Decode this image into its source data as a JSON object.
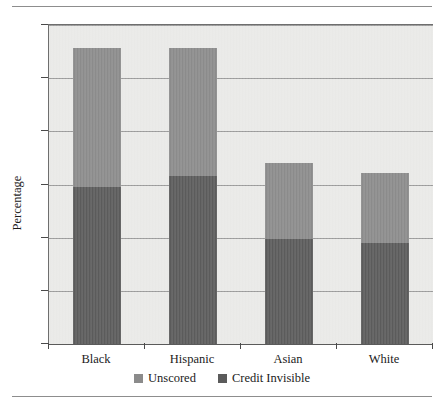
{
  "chart_data": {
    "type": "bar",
    "subtype": "stacked-vertical",
    "title": "",
    "xlabel": "",
    "ylabel": "Percentage",
    "categories": [
      "Black",
      "Hispanic",
      "Asian",
      "White"
    ],
    "series": [
      {
        "name": "Credit Invisible",
        "color": "#5b5b5b",
        "values": [
          14.8,
          15.8,
          9.9,
          9.5
        ]
      },
      {
        "name": "Unscored",
        "color": "#8b8b8b",
        "values": [
          13.0,
          12.0,
          7.1,
          6.6
        ]
      }
    ],
    "totals": [
      27.8,
      27.8,
      17.0,
      16.1
    ],
    "ylim": [
      0,
      30
    ],
    "yticks": [
      0,
      5,
      10,
      15,
      20,
      25,
      30
    ],
    "ytick_labels": [
      "0",
      "5",
      "10",
      "15",
      "20",
      "25",
      "30"
    ],
    "grid": true,
    "grid_axis": "y",
    "legend_position": "bottom",
    "legend_order": [
      "Unscored",
      "Credit Invisible"
    ],
    "plot_background": "#e9e9e7"
  },
  "axis": {
    "y_title": "Percentage",
    "y_tick_labels": [
      "30",
      "25",
      "20",
      "15",
      "10",
      "5",
      "0"
    ],
    "x_tick_labels": [
      "Black",
      "Hispanic",
      "Asian",
      "White"
    ]
  },
  "legend": {
    "items": [
      {
        "label": "Unscored",
        "color": "#8b8b8b",
        "swatch_name": "legend-swatch-unscored"
      },
      {
        "label": "Credit Invisible",
        "color": "#5b5b5b",
        "swatch_name": "legend-swatch-credit-invisible"
      }
    ]
  }
}
